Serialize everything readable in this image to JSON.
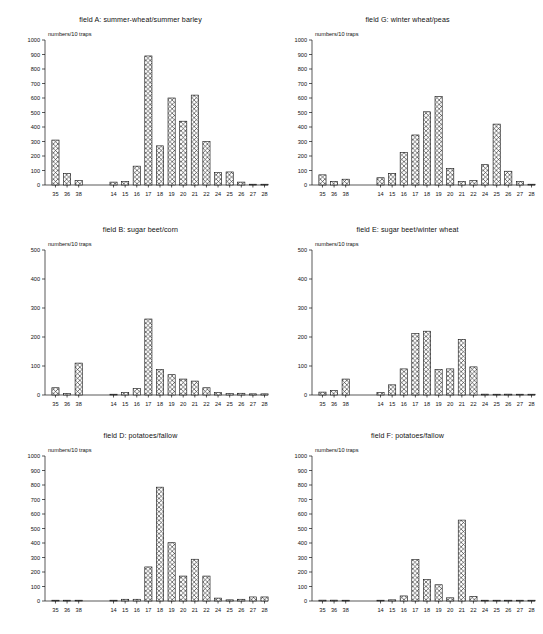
{
  "figure": {
    "width": 543,
    "height": 634,
    "background": "#ffffff",
    "foreground": "#111111"
  },
  "shared": {
    "ylabel": "numbers/10 traps",
    "categories": [
      "35",
      "36",
      "38",
      "14",
      "15",
      "16",
      "17",
      "18",
      "19",
      "20",
      "21",
      "22",
      "24",
      "25",
      "26",
      "27",
      "28"
    ],
    "group_break_after_index": 2
  },
  "chart_data": [
    {
      "type": "bar",
      "id": "field-a",
      "title": "field A: summer-wheat/summer barley",
      "xlabel": "",
      "ylabel": "numbers/10 traps",
      "categories": [
        "35",
        "36",
        "38",
        "14",
        "15",
        "16",
        "17",
        "18",
        "19",
        "20",
        "21",
        "22",
        "24",
        "25",
        "26",
        "27",
        "28"
      ],
      "values": [
        310,
        80,
        30,
        20,
        25,
        130,
        890,
        270,
        600,
        440,
        620,
        300,
        85,
        90,
        20,
        5,
        5
      ],
      "ylim": [
        0,
        1000
      ],
      "yticks": [
        0,
        100,
        200,
        300,
        400,
        500,
        600,
        700,
        800,
        900,
        1000
      ],
      "grid": false,
      "legend": "none"
    },
    {
      "type": "bar",
      "id": "field-g",
      "title": "field G: winter wheat/peas",
      "xlabel": "",
      "ylabel": "numbers/10 traps",
      "categories": [
        "35",
        "36",
        "38",
        "14",
        "15",
        "16",
        "17",
        "18",
        "19",
        "20",
        "21",
        "22",
        "24",
        "25",
        "26",
        "27",
        "28"
      ],
      "values": [
        70,
        25,
        40,
        50,
        80,
        225,
        345,
        505,
        610,
        115,
        25,
        30,
        140,
        420,
        95,
        25,
        5
      ],
      "ylim": [
        0,
        1000
      ],
      "yticks": [
        0,
        100,
        200,
        300,
        400,
        500,
        600,
        700,
        800,
        900,
        1000
      ],
      "grid": false,
      "legend": "none"
    },
    {
      "type": "bar",
      "id": "field-b",
      "title": "field B: sugar beet/corn",
      "xlabel": "",
      "ylabel": "numbers/10 traps",
      "categories": [
        "35",
        "36",
        "38",
        "14",
        "15",
        "16",
        "17",
        "18",
        "19",
        "20",
        "21",
        "22",
        "24",
        "25",
        "26",
        "27",
        "28"
      ],
      "values": [
        25,
        5,
        110,
        2,
        8,
        22,
        262,
        88,
        70,
        55,
        48,
        25,
        8,
        5,
        6,
        4,
        4
      ],
      "ylim": [
        0,
        500
      ],
      "yticks": [
        0,
        100,
        200,
        300,
        400,
        500
      ],
      "grid": false,
      "legend": "none"
    },
    {
      "type": "bar",
      "id": "field-e",
      "title": "field E: sugar beet/winter wheat",
      "xlabel": "",
      "ylabel": "numbers/10 traps",
      "categories": [
        "35",
        "36",
        "38",
        "14",
        "15",
        "16",
        "17",
        "18",
        "19",
        "20",
        "21",
        "22",
        "24",
        "25",
        "26",
        "27",
        "28"
      ],
      "values": [
        10,
        15,
        55,
        8,
        35,
        90,
        212,
        220,
        88,
        90,
        192,
        97,
        3,
        2,
        3,
        2,
        2
      ],
      "ylim": [
        0,
        500
      ],
      "yticks": [
        0,
        100,
        200,
        300,
        400,
        500
      ],
      "grid": false,
      "legend": "none"
    },
    {
      "type": "bar",
      "id": "field-d",
      "title": "field D: potatoes/fallow",
      "xlabel": "",
      "ylabel": "numbers/10 traps",
      "categories": [
        "35",
        "36",
        "38",
        "14",
        "15",
        "16",
        "17",
        "18",
        "19",
        "20",
        "21",
        "22",
        "24",
        "25",
        "26",
        "27",
        "28"
      ],
      "values": [
        4,
        4,
        4,
        4,
        12,
        12,
        235,
        785,
        402,
        172,
        288,
        172,
        20,
        8,
        12,
        28,
        28
      ],
      "ylim": [
        0,
        1000
      ],
      "yticks": [
        0,
        100,
        200,
        300,
        400,
        500,
        600,
        700,
        800,
        900,
        1000
      ],
      "grid": false,
      "legend": "none"
    },
    {
      "type": "bar",
      "id": "field-f",
      "title": "field F: potatoes/fallow",
      "xlabel": "",
      "ylabel": "numbers/10 traps",
      "categories": [
        "35",
        "36",
        "38",
        "14",
        "15",
        "16",
        "17",
        "18",
        "19",
        "20",
        "21",
        "22",
        "24",
        "25",
        "26",
        "27",
        "28"
      ],
      "values": [
        6,
        6,
        5,
        4,
        8,
        35,
        285,
        148,
        112,
        22,
        558,
        32,
        5,
        4,
        4,
        4,
        4
      ],
      "ylim": [
        0,
        1000
      ],
      "yticks": [
        0,
        100,
        200,
        300,
        400,
        500,
        600,
        700,
        800,
        900,
        1000
      ],
      "grid": false,
      "legend": "none"
    }
  ]
}
